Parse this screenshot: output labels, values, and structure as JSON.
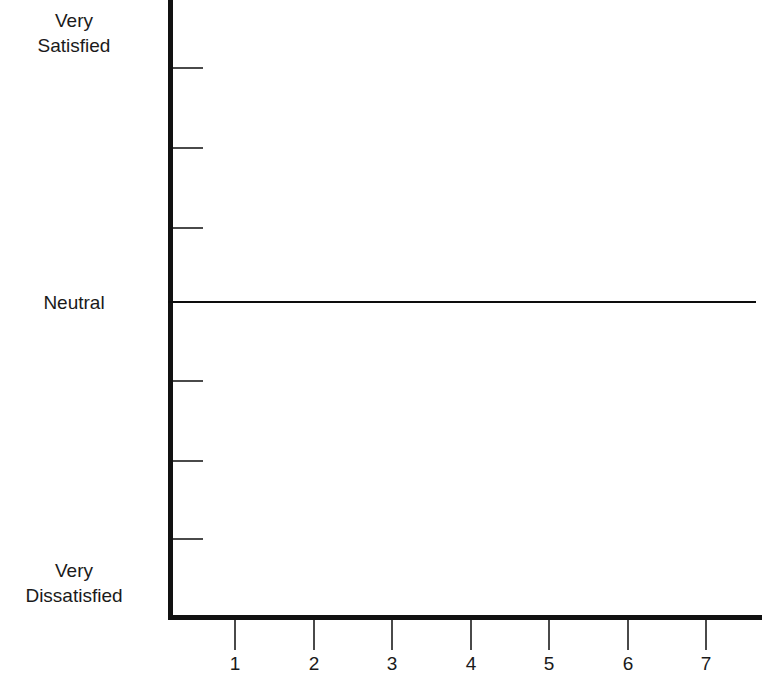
{
  "chart_data": {
    "type": "line",
    "title": "",
    "subtitle": "",
    "xlabel": "",
    "ylabel": "",
    "grid": false,
    "legend": null,
    "series": [
      {
        "name": "Neutral reference line",
        "x": [
          1,
          2,
          3,
          4,
          5,
          6,
          7
        ],
        "values": [
          0,
          0,
          0,
          0,
          0,
          0,
          0
        ]
      }
    ],
    "x": [
      1,
      2,
      3,
      4,
      5,
      6,
      7
    ],
    "categories": [
      "1",
      "2",
      "3",
      "4",
      "5",
      "6",
      "7"
    ],
    "xtick_labels": [
      "1",
      "2",
      "3",
      "4",
      "5",
      "6",
      "7"
    ],
    "xlim": [
      0.7,
      7.4
    ],
    "ylim": [
      -3.5,
      3.5
    ],
    "ytick_labels": [
      "Very\nSatisfied",
      "",
      "",
      "Neutral",
      "",
      "",
      "Very\nDissatisfied"
    ],
    "y_named_labels": [
      {
        "text": "Very\nSatisfied",
        "value": 3
      },
      {
        "text": "Neutral",
        "value": 0
      },
      {
        "text": "Very\nDissatisfied",
        "value": -3
      }
    ],
    "annotations": []
  },
  "axes": {
    "y_axis_name": "satisfaction-axis",
    "x_axis_name": "scale-axis",
    "axis_color": "#111111",
    "tick_color": "#4a4a4a",
    "neutral_line_color": "#0d0d0d",
    "background": "#ffffff"
  },
  "y_ticks": [
    {
      "id": "ytick-1",
      "top": 67
    },
    {
      "id": "ytick-2",
      "top": 147
    },
    {
      "id": "ytick-3",
      "top": 227
    },
    {
      "id": "ytick-4",
      "top": 380
    },
    {
      "id": "ytick-5",
      "top": 460
    },
    {
      "id": "ytick-6",
      "top": 538
    }
  ],
  "x_ticks": [
    {
      "id": "xtick-1",
      "label": "1",
      "left": 234
    },
    {
      "id": "xtick-2",
      "label": "2",
      "left": 313
    },
    {
      "id": "xtick-3",
      "label": "3",
      "left": 391
    },
    {
      "id": "xtick-4",
      "label": "4",
      "left": 470
    },
    {
      "id": "xtick-5",
      "label": "5",
      "left": 548
    },
    {
      "id": "xtick-6",
      "label": "6",
      "left": 627
    },
    {
      "id": "xtick-7",
      "label": "7",
      "left": 705
    }
  ],
  "y_labels": [
    {
      "id": "ylabel-very-satisfied",
      "text": "Very\nSatisfied",
      "top": 8
    },
    {
      "id": "ylabel-neutral",
      "text": "Neutral",
      "top": 290
    },
    {
      "id": "ylabel-very-dissatisfied",
      "text": "Very\nDissatisfied",
      "top": 558
    }
  ]
}
